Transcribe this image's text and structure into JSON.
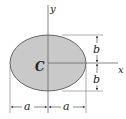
{
  "diagram": {
    "labels": {
      "centroid": "C",
      "x_axis": "x",
      "y_axis": "y",
      "semi_minor_top": "b",
      "semi_minor_bottom": "b",
      "semi_major_left": "a",
      "semi_major_right": "a"
    },
    "colors": {
      "fill": "#c9c9c9",
      "stroke": "#444444",
      "line": "#555555",
      "text": "#222222"
    }
  }
}
